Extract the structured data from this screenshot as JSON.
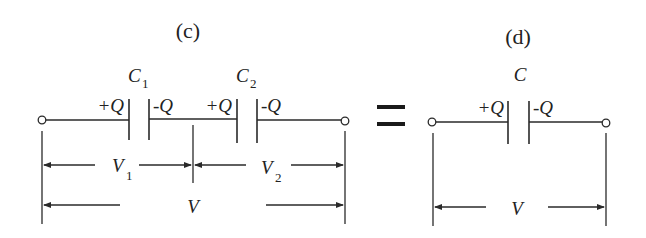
{
  "figure": {
    "panel_c": {
      "title": "(c)",
      "capacitors": [
        {
          "name": "C",
          "subscript": "1",
          "left_charge": "+Q",
          "right_charge": "-Q"
        },
        {
          "name": "C",
          "subscript": "2",
          "left_charge": "+Q",
          "right_charge": "-Q"
        }
      ],
      "voltages": {
        "v1": {
          "name": "V",
          "subscript": "1"
        },
        "v2": {
          "name": "V",
          "subscript": "2"
        },
        "total": {
          "name": "V"
        }
      }
    },
    "equals": "=",
    "panel_d": {
      "title": "(d)",
      "capacitor": {
        "name": "C",
        "left_charge": "+Q",
        "right_charge": "-Q"
      },
      "voltage": {
        "name": "V"
      }
    },
    "colors": {
      "stroke": "#2a2a2a",
      "text": "#222222",
      "background": "#ffffff"
    }
  }
}
